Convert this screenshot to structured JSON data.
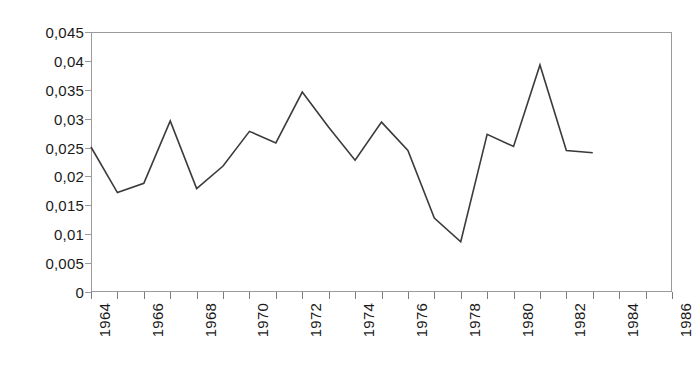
{
  "chart_data": {
    "type": "line",
    "title": "",
    "subtitle": "",
    "xlabel": "",
    "ylabel": "",
    "legend": [],
    "grid": false,
    "decimal_separator": ",",
    "xlim": [
      1964,
      1986
    ],
    "ylim": [
      0,
      0.045
    ],
    "y_ticks": [
      0.045,
      0.04,
      0.035,
      0.03,
      0.025,
      0.02,
      0.015,
      0.01,
      0.005,
      0
    ],
    "y_tick_labels": [
      "0,045",
      "0,04",
      "0,035",
      "0,03",
      "0,025",
      "0,02",
      "0,015",
      "0,01",
      "0,005",
      "0"
    ],
    "x_ticks": [
      1964,
      1965,
      1966,
      1967,
      1968,
      1969,
      1970,
      1971,
      1972,
      1973,
      1974,
      1975,
      1976,
      1977,
      1978,
      1979,
      1980,
      1981,
      1982,
      1983,
      1984,
      1985,
      1986
    ],
    "x_tick_labels": [
      "1964",
      "",
      "1966",
      "",
      "1968",
      "",
      "1970",
      "",
      "1972",
      "",
      "1974",
      "",
      "1976",
      "",
      "1978",
      "",
      "1980",
      "",
      "1982",
      "",
      "1984",
      "",
      "1986"
    ],
    "x": [
      1964,
      1965,
      1966,
      1967,
      1968,
      1969,
      1970,
      1971,
      1972,
      1973,
      1974,
      1975,
      1976,
      1977,
      1978,
      1979,
      1980,
      1981,
      1982,
      1983
    ],
    "values": [
      0.0251,
      0.0172,
      0.0188,
      0.0296,
      0.0179,
      0.0218,
      0.0278,
      0.0258,
      0.0346,
      0.0285,
      0.0228,
      0.0294,
      0.0245,
      0.0128,
      0.0087,
      0.0273,
      0.0252,
      0.0393,
      0.0245,
      0.0241
    ],
    "series": [
      {
        "name": "series-1",
        "color": "#3b3b3b",
        "values": [
          0.0251,
          0.0172,
          0.0188,
          0.0296,
          0.0179,
          0.0218,
          0.0278,
          0.0258,
          0.0346,
          0.0285,
          0.0228,
          0.0294,
          0.0245,
          0.0128,
          0.0087,
          0.0273,
          0.0252,
          0.0393,
          0.0245,
          0.0241
        ]
      }
    ],
    "colors": {
      "line": "#3b3b3b",
      "axis": "#9a9a9a",
      "tick": "#7c7c7c",
      "background": "#ffffff",
      "text": "#1a1a1a"
    }
  }
}
